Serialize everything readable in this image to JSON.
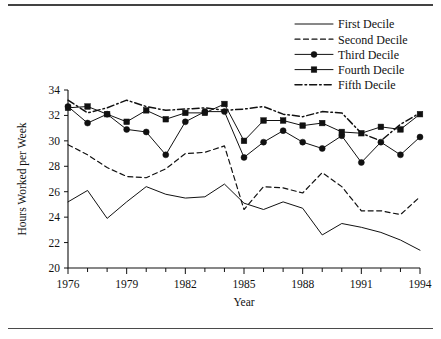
{
  "figure": {
    "has_top_rule": true,
    "has_bottom_rule": true,
    "background": "#ffffff",
    "ink_color": "#111111"
  },
  "chart_data": {
    "type": "line",
    "title": "",
    "xlabel": "Year",
    "ylabel": "Hours Worked per Week",
    "xlim": [
      1976,
      1994
    ],
    "ylim": [
      20,
      34
    ],
    "yticks": [
      20,
      22,
      24,
      26,
      28,
      30,
      32,
      34
    ],
    "ytick_labels": [
      "20",
      "22",
      "24",
      "26",
      "28",
      "30",
      "32",
      "34"
    ],
    "xticks": [
      1976,
      1977,
      1978,
      1979,
      1980,
      1981,
      1982,
      1983,
      1984,
      1985,
      1986,
      1987,
      1988,
      1989,
      1990,
      1991,
      1992,
      1993,
      1994
    ],
    "xtick_labels": [
      "1976",
      "",
      "",
      "1979",
      "",
      "",
      "1982",
      "",
      "",
      "1985",
      "",
      "",
      "1988",
      "",
      "",
      "1991",
      "",
      "",
      "1994"
    ],
    "grid": false,
    "legend_position": "top-right",
    "x": [
      1976,
      1977,
      1978,
      1979,
      1980,
      1981,
      1982,
      1983,
      1984,
      1985,
      1986,
      1987,
      1988,
      1989,
      1990,
      1991,
      1992,
      1993,
      1994
    ],
    "series": [
      {
        "name": "First Decile",
        "style": "solid",
        "marker": "none",
        "values": [
          25.2,
          26.1,
          23.9,
          25.2,
          26.4,
          25.8,
          25.5,
          25.6,
          26.6,
          25.1,
          24.6,
          25.2,
          24.7,
          22.6,
          23.5,
          23.2,
          22.8,
          22.2,
          21.4
        ]
      },
      {
        "name": "Second Decile",
        "style": "dashed",
        "marker": "none",
        "values": [
          29.7,
          28.9,
          27.9,
          27.2,
          27.1,
          27.8,
          29.0,
          29.1,
          29.6,
          24.6,
          26.4,
          26.3,
          25.9,
          27.5,
          26.4,
          24.5,
          24.5,
          24.2,
          25.6
        ]
      },
      {
        "name": "Third Decile",
        "style": "solid",
        "marker": "circle",
        "values": [
          32.7,
          31.4,
          32.1,
          30.9,
          30.7,
          28.9,
          31.5,
          32.3,
          32.3,
          28.7,
          29.9,
          30.8,
          29.9,
          29.4,
          30.4,
          28.3,
          29.9,
          28.9,
          30.3
        ]
      },
      {
        "name": "Fourth Decile",
        "style": "solid",
        "marker": "square",
        "values": [
          32.6,
          32.7,
          32.1,
          31.5,
          32.4,
          31.7,
          32.2,
          32.2,
          32.9,
          30.0,
          31.6,
          31.6,
          31.2,
          31.4,
          30.7,
          30.6,
          31.1,
          30.9,
          32.1
        ]
      },
      {
        "name": "Fifth Decile",
        "style": "dashdot",
        "marker": "none",
        "values": [
          33.2,
          32.2,
          32.6,
          33.2,
          32.7,
          32.4,
          32.5,
          32.6,
          32.4,
          32.5,
          32.7,
          32.1,
          31.9,
          32.3,
          32.2,
          30.6,
          30.0,
          31.3,
          32.2
        ]
      }
    ]
  },
  "legend": {
    "entries": [
      {
        "label": "First Decile"
      },
      {
        "label": "Second Decile"
      },
      {
        "label": "Third Decile"
      },
      {
        "label": "Fourth Decile"
      },
      {
        "label": "Fifth Decile"
      }
    ]
  }
}
